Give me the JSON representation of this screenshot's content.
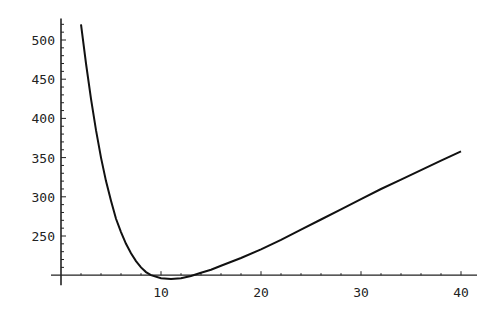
{
  "chart_data": {
    "type": "line",
    "title": "",
    "xlabel": "",
    "ylabel": "",
    "xlim": [
      0,
      41
    ],
    "ylim": [
      200,
      525
    ],
    "axis_origin": {
      "x": 0,
      "y": 200
    },
    "grid": false,
    "legend": null,
    "x_ticks": [
      10,
      20,
      30,
      40
    ],
    "y_ticks": [
      250,
      300,
      350,
      400,
      450,
      500
    ],
    "series": [
      {
        "name": "curve",
        "x": [
          2,
          2.5,
          3,
          3.5,
          4,
          4.5,
          5,
          5.5,
          6,
          6.5,
          7,
          7.5,
          8,
          8.5,
          9,
          10,
          11,
          12,
          13,
          14,
          15,
          16,
          18,
          20,
          22,
          24,
          26,
          28,
          30,
          32,
          34,
          36,
          38,
          40
        ],
        "values": [
          520,
          470,
          425,
          385,
          350,
          320,
          295,
          272,
          255,
          240,
          228,
          218,
          210,
          204,
          200,
          196,
          195,
          196,
          199,
          203,
          207,
          212,
          222,
          233,
          245,
          258,
          271,
          284,
          297,
          310,
          322,
          334,
          346,
          358
        ]
      }
    ]
  }
}
